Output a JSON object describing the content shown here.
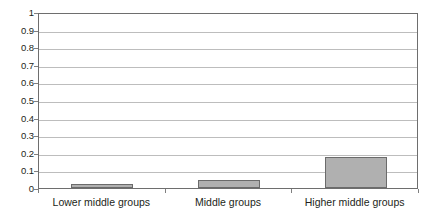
{
  "chart_data": {
    "type": "bar",
    "title": "",
    "subtitle": "",
    "xlabel": "",
    "ylabel": "",
    "categories": [
      "Lower middle groups",
      "Middle groups",
      "Higher middle groups"
    ],
    "values": [
      0.025,
      0.045,
      0.175
    ],
    "ylim": [
      0,
      1
    ],
    "ytick_labels": [
      "0",
      "0.1",
      "0.2",
      "0.3",
      "0.4",
      "0.5",
      "0.6",
      "0.7",
      "0.8",
      "0.9",
      "1"
    ],
    "ytick_values": [
      0,
      0.1,
      0.2,
      0.3,
      0.4,
      0.5,
      0.6,
      0.7,
      0.8,
      0.9,
      1
    ],
    "grid": true,
    "grid_axis": "y",
    "legend": false,
    "legend_position": "none",
    "annotations": [],
    "series": [
      {
        "name": "",
        "values": [
          0.025,
          0.045,
          0.175
        ]
      }
    ],
    "colors": {
      "bar_fill": "#b0b0b0",
      "bar_border": "#6b6b6b",
      "gridline": "#bdbdbd",
      "axis": "#6e6e6e",
      "text": "#231f20",
      "background": "#ffffff"
    }
  }
}
